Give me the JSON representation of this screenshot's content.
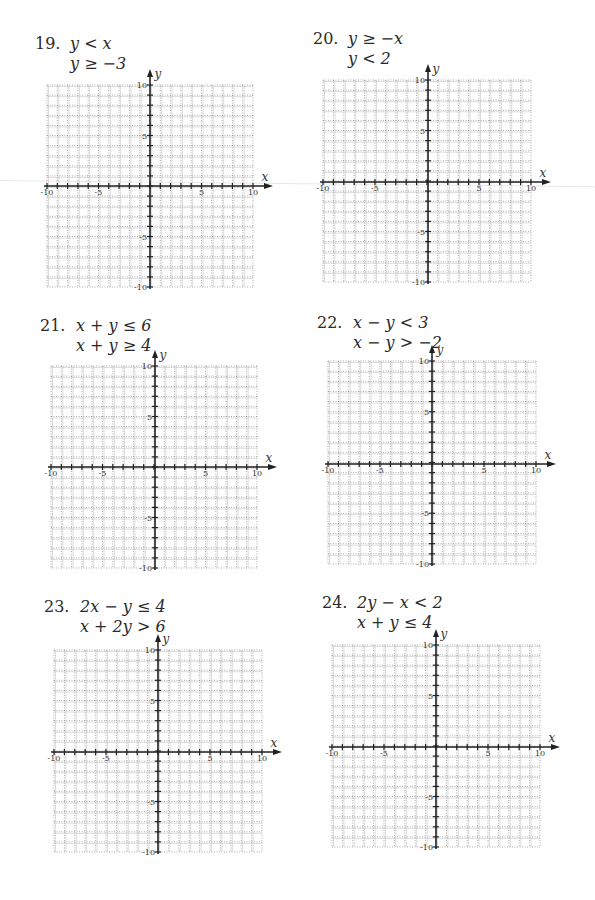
{
  "page": {
    "problems": [
      {
        "number": "19.",
        "line1": "y < x",
        "line2": "y ≥ −3"
      },
      {
        "number": "20.",
        "line1": "y ≥ −x",
        "line2": "y < 2"
      },
      {
        "number": "21.",
        "line1": "x + y ≤ 6",
        "line2": "x + y ≥ 4"
      },
      {
        "number": "22.",
        "line1": "x − y < 3",
        "line2": "x − y > −2"
      },
      {
        "number": "23.",
        "line1": "2x − y ≤ 4",
        "line2": "x + 2y > 6"
      },
      {
        "number": "24.",
        "line1": "2y − x < 2",
        "line2": "x + y ≤ 4"
      }
    ],
    "axis": {
      "x_label": "x",
      "y_label": "y",
      "x_ticks": [
        "-10",
        "-5",
        "5",
        "10"
      ],
      "y_ticks": [
        "10",
        "5",
        "-5",
        "-10"
      ],
      "range": [
        -10,
        10
      ]
    }
  }
}
